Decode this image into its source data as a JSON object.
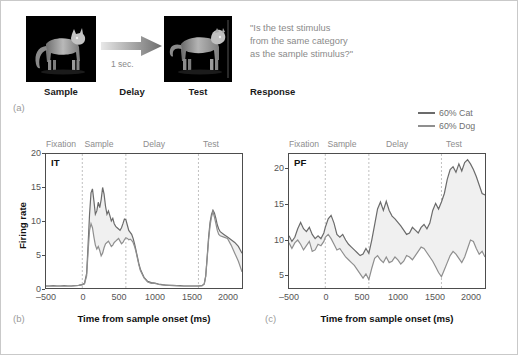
{
  "figure": {
    "panel_a_letter": "(a)",
    "panel_b_letter": "(b)",
    "panel_c_letter": "(c)"
  },
  "task_diagram": {
    "sample_label": "Sample",
    "delay_label": "Delay",
    "test_label": "Test",
    "response_label": "Response",
    "delay_duration": "1 sec.",
    "question_text": "\"Is the test stimulus\nfrom the same category\nas the sample stimulus?\"",
    "sample_image_alt": "cat-silhouette",
    "test_image_alt": "dog-silhouette",
    "arrow_alt": "right-arrow"
  },
  "legend": {
    "items": [
      {
        "label": "60% Cat",
        "color": "#6b6b6b"
      },
      {
        "label": "60% Dog",
        "color": "#8f8f8f"
      }
    ]
  },
  "chart_data": [
    {
      "type": "line",
      "panel": "(b)",
      "region_label": "IT",
      "title": "IT",
      "xlabel": "Time from sample onset (ms)",
      "ylabel": "Firing rate",
      "xlim": [
        -500,
        2200
      ],
      "ylim": [
        0,
        20
      ],
      "xticks": [
        -500,
        0,
        500,
        1000,
        1500,
        2000
      ],
      "xticklabels": [
        "–500",
        "0",
        "500",
        "1000",
        "1500",
        "2000"
      ],
      "yticks": [
        0,
        5,
        10,
        15,
        20
      ],
      "yticklabels": [
        "0",
        "5",
        "10",
        "15",
        "20"
      ],
      "grid": false,
      "epochs": [
        {
          "label": "Fixation",
          "start": -500,
          "end": 0
        },
        {
          "label": "Sample",
          "start": 0,
          "end": 600
        },
        {
          "label": "Delay",
          "start": 600,
          "end": 1600
        },
        {
          "label": "Test",
          "start": 1600,
          "end": 2200
        }
      ],
      "event_lines": [
        0,
        600,
        1600
      ],
      "legend_position": "outside top-right",
      "series": [
        {
          "name": "60% Cat",
          "color": "#6b6b6b",
          "x": [
            -500,
            -450,
            -400,
            -350,
            -300,
            -250,
            -200,
            -150,
            -100,
            -50,
            0,
            30,
            60,
            80,
            100,
            120,
            140,
            160,
            180,
            200,
            220,
            240,
            260,
            280,
            300,
            320,
            340,
            360,
            380,
            400,
            420,
            440,
            460,
            480,
            500,
            520,
            540,
            560,
            580,
            600,
            620,
            640,
            660,
            680,
            700,
            720,
            740,
            760,
            780,
            800,
            850,
            900,
            950,
            1000,
            1050,
            1100,
            1150,
            1200,
            1250,
            1300,
            1350,
            1400,
            1450,
            1500,
            1550,
            1600,
            1650,
            1680,
            1700,
            1720,
            1740,
            1760,
            1780,
            1800,
            1820,
            1840,
            1860,
            1880,
            1900,
            1950,
            2000,
            2050,
            2100,
            2150,
            2200
          ],
          "y": [
            0.3,
            0.3,
            0.35,
            0.3,
            0.3,
            0.35,
            0.3,
            0.3,
            0.35,
            0.4,
            0.5,
            0.7,
            2.2,
            6.5,
            11.0,
            14.2,
            14.8,
            13.0,
            11.0,
            11.5,
            12.8,
            12.0,
            13.2,
            15.0,
            14.0,
            12.2,
            11.0,
            11.5,
            10.8,
            10.0,
            10.4,
            9.6,
            9.2,
            9.0,
            8.8,
            8.6,
            9.0,
            9.6,
            10.3,
            10.2,
            9.4,
            8.6,
            8.3,
            8.0,
            7.4,
            6.6,
            5.6,
            4.6,
            3.6,
            2.8,
            1.6,
            1.0,
            0.8,
            0.75,
            0.6,
            0.5,
            0.45,
            0.4,
            0.4,
            0.35,
            0.35,
            0.3,
            0.3,
            0.3,
            0.3,
            0.3,
            0.35,
            0.6,
            1.8,
            4.6,
            7.6,
            9.8,
            11.0,
            11.6,
            11.2,
            10.4,
            9.4,
            8.8,
            8.4,
            8.0,
            7.6,
            7.2,
            6.8,
            6.2,
            5.2
          ]
        },
        {
          "name": "60% Dog",
          "color": "#8f8f8f",
          "x": [
            -500,
            -450,
            -400,
            -350,
            -300,
            -250,
            -200,
            -150,
            -100,
            -50,
            0,
            30,
            60,
            80,
            100,
            120,
            140,
            160,
            180,
            200,
            220,
            240,
            260,
            280,
            300,
            320,
            340,
            360,
            380,
            400,
            420,
            440,
            460,
            480,
            500,
            520,
            540,
            560,
            580,
            600,
            620,
            640,
            660,
            680,
            700,
            720,
            740,
            760,
            780,
            800,
            850,
            900,
            950,
            1000,
            1050,
            1100,
            1150,
            1200,
            1250,
            1300,
            1350,
            1400,
            1450,
            1500,
            1550,
            1600,
            1650,
            1680,
            1700,
            1720,
            1740,
            1760,
            1780,
            1800,
            1820,
            1840,
            1860,
            1880,
            1900,
            1950,
            2000,
            2050,
            2100,
            2150,
            2200
          ],
          "y": [
            0.3,
            0.3,
            0.3,
            0.3,
            0.3,
            0.3,
            0.3,
            0.3,
            0.35,
            0.4,
            0.5,
            0.6,
            1.8,
            5.4,
            8.6,
            9.6,
            9.0,
            7.6,
            6.4,
            5.8,
            6.2,
            5.6,
            4.8,
            5.2,
            6.0,
            6.6,
            6.8,
            7.0,
            6.6,
            6.2,
            6.4,
            6.8,
            7.0,
            7.2,
            7.4,
            7.0,
            6.6,
            6.8,
            7.2,
            7.5,
            7.4,
            7.2,
            7.3,
            7.1,
            6.8,
            6.2,
            5.4,
            4.4,
            3.4,
            2.6,
            1.5,
            0.9,
            0.7,
            0.7,
            0.55,
            0.45,
            0.4,
            0.4,
            0.35,
            0.35,
            0.3,
            0.3,
            0.3,
            0.3,
            0.3,
            0.3,
            0.35,
            0.6,
            1.7,
            4.4,
            7.2,
            9.3,
            10.6,
            11.4,
            10.6,
            9.6,
            8.6,
            8.0,
            7.8,
            7.6,
            7.4,
            6.4,
            5.2,
            4.0,
            2.4
          ]
        }
      ]
    },
    {
      "type": "line",
      "panel": "(c)",
      "region_label": "PF",
      "title": "PF",
      "xlabel": "Time from sample onset (ms)",
      "ylabel": "Firing rate",
      "xlim": [
        -500,
        2200
      ],
      "ylim": [
        3,
        22
      ],
      "xticks": [
        -500,
        0,
        500,
        1000,
        1500,
        2000
      ],
      "xticklabels": [
        "–500",
        "0",
        "500",
        "1000",
        "1500",
        "2000"
      ],
      "yticks": [
        5,
        10,
        15,
        20
      ],
      "yticklabels": [
        "5",
        "10",
        "15",
        "20"
      ],
      "grid": false,
      "epochs": [
        {
          "label": "Fixation",
          "start": -500,
          "end": 0
        },
        {
          "label": "Sample",
          "start": 0,
          "end": 600
        },
        {
          "label": "Delay",
          "start": 600,
          "end": 1600
        },
        {
          "label": "Test",
          "start": 1600,
          "end": 2200
        }
      ],
      "event_lines": [
        0,
        600,
        1600
      ],
      "legend_position": "outside top-right",
      "series": [
        {
          "name": "60% Cat",
          "color": "#6b6b6b",
          "x": [
            -500,
            -460,
            -420,
            -380,
            -340,
            -300,
            -260,
            -220,
            -180,
            -140,
            -100,
            -60,
            -20,
            0,
            40,
            80,
            120,
            160,
            200,
            240,
            280,
            320,
            360,
            400,
            440,
            480,
            520,
            560,
            600,
            640,
            680,
            720,
            760,
            800,
            840,
            880,
            920,
            960,
            1000,
            1040,
            1080,
            1120,
            1160,
            1200,
            1240,
            1280,
            1320,
            1360,
            1400,
            1440,
            1480,
            1520,
            1560,
            1600,
            1640,
            1680,
            1720,
            1760,
            1800,
            1840,
            1880,
            1920,
            1960,
            2000,
            2040,
            2080,
            2120,
            2160,
            2200
          ],
          "y": [
            10.4,
            9.6,
            10.2,
            11.4,
            12.3,
            11.4,
            11.0,
            11.6,
            10.6,
            10.0,
            10.4,
            10.0,
            10.8,
            11.6,
            12.8,
            13.3,
            12.2,
            10.6,
            10.2,
            10.6,
            9.8,
            9.2,
            8.8,
            8.4,
            8.0,
            7.6,
            7.8,
            8.6,
            7.9,
            9.8,
            12.0,
            14.2,
            15.2,
            14.0,
            15.3,
            14.0,
            13.2,
            12.8,
            12.3,
            11.8,
            11.2,
            10.6,
            10.8,
            11.6,
            11.2,
            10.8,
            11.6,
            12.0,
            11.4,
            12.2,
            14.0,
            15.0,
            14.2,
            15.2,
            16.4,
            18.4,
            19.8,
            20.2,
            19.4,
            20.6,
            19.6,
            20.8,
            21.2,
            20.6,
            19.8,
            18.8,
            17.6,
            16.4,
            16.2
          ]
        },
        {
          "name": "60% Dog",
          "color": "#8f8f8f",
          "x": [
            -500,
            -460,
            -420,
            -380,
            -340,
            -300,
            -260,
            -220,
            -180,
            -140,
            -100,
            -60,
            -20,
            0,
            40,
            80,
            120,
            160,
            200,
            240,
            280,
            320,
            360,
            400,
            440,
            480,
            520,
            560,
            600,
            640,
            680,
            720,
            760,
            800,
            840,
            880,
            920,
            960,
            1000,
            1040,
            1080,
            1120,
            1160,
            1200,
            1240,
            1280,
            1320,
            1360,
            1400,
            1440,
            1480,
            1520,
            1560,
            1600,
            1640,
            1680,
            1720,
            1760,
            1800,
            1840,
            1880,
            1920,
            1960,
            2000,
            2040,
            2080,
            2120,
            2160,
            2200
          ],
          "y": [
            9.4,
            8.6,
            9.4,
            9.8,
            9.2,
            8.4,
            9.0,
            9.6,
            8.2,
            8.4,
            9.2,
            9.0,
            9.6,
            10.2,
            10.6,
            10.0,
            9.2,
            8.4,
            8.6,
            8.0,
            7.4,
            7.0,
            6.6,
            6.2,
            5.6,
            5.0,
            4.4,
            5.0,
            4.2,
            5.8,
            7.2,
            7.6,
            7.0,
            6.6,
            7.4,
            6.6,
            6.8,
            7.4,
            7.0,
            6.4,
            6.8,
            7.6,
            7.4,
            7.0,
            7.6,
            8.2,
            8.8,
            8.6,
            8.0,
            7.4,
            6.8,
            6.0,
            5.2,
            4.6,
            5.6,
            6.6,
            7.6,
            8.2,
            7.8,
            7.2,
            6.6,
            7.4,
            8.6,
            9.8,
            9.6,
            8.6,
            7.8,
            8.2,
            7.4
          ]
        }
      ]
    }
  ]
}
